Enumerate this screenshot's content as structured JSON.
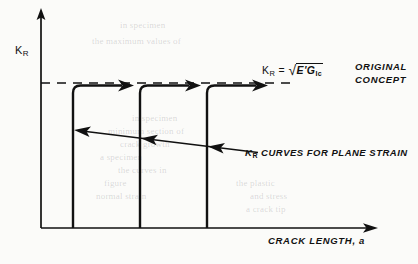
{
  "figure": {
    "type": "line-diagram",
    "background_color": "#fbfbf9",
    "ink_color": "#111111"
  },
  "axes": {
    "y_label": "K",
    "y_label_sub": "R",
    "x_label": "CRACK LENGTH, ",
    "x_label_italic": "a",
    "origin": {
      "x": 41,
      "y": 228
    },
    "y_axis_top": 10,
    "x_axis_right": 378
  },
  "plateau": {
    "dashed_level_y": 83,
    "equation_lhs": "K",
    "equation_lhs_sub": "R",
    "equation_eq": "=",
    "equation_radicand": "E'G",
    "equation_radicand_sub": "Ic",
    "radical_sign": "√",
    "concept_line1": "ORIGINAL",
    "concept_line2": "CONCEPT"
  },
  "annotations": {
    "curves_label_lhs": "K",
    "curves_label_sub": "R",
    "curves_label_rest": " CURVES FOR PLANE STRAIN"
  },
  "chart_data": {
    "type": "line",
    "title": "",
    "xlabel": "CRACK LENGTH, a",
    "ylabel": "K_R",
    "grid": false,
    "legend": "none",
    "axis_ticks": {
      "x": [],
      "y": []
    },
    "reference_lines": [
      {
        "name": "original-concept-plateau",
        "orientation": "horizontal",
        "style": "dashed",
        "label": "K_R = sqrt(E'G_Ic)",
        "annotation": "ORIGINAL CONCEPT"
      }
    ],
    "series": [
      {
        "name": "K_R curve 1 (plane strain)",
        "shape": "step-rise-then-plateau",
        "riser_x": 73,
        "rise_from_y": 228,
        "plateau_y": 85,
        "plateau_to_x": 131,
        "arrow": "right"
      },
      {
        "name": "K_R curve 2 (plane strain)",
        "shape": "step-rise-then-plateau",
        "riser_x": 140,
        "rise_from_y": 228,
        "plateau_y": 85,
        "plateau_to_x": 198,
        "arrow": "right"
      },
      {
        "name": "K_R curve 3 (plane strain)",
        "shape": "step-rise-then-plateau",
        "riser_x": 207,
        "rise_from_y": 228,
        "plateau_y": 85,
        "plateau_to_x": 266,
        "arrow": "right"
      }
    ],
    "leader_arrows": [
      {
        "from_x": 258,
        "from_y": 152,
        "to_x": 80,
        "to_y": 131
      },
      {
        "to_x": 147,
        "to_y": 139
      },
      {
        "to_x": 214,
        "to_y": 147
      }
    ]
  },
  "bleed_through": [
    {
      "text": "in specimen",
      "x": 120,
      "y": 20
    },
    {
      "text": "the maximum values of",
      "x": 92,
      "y": 36
    },
    {
      "text": "in specimen",
      "x": 132,
      "y": 113
    },
    {
      "text": "minimum section of",
      "x": 108,
      "y": 126
    },
    {
      "text": "crack growth",
      "x": 120,
      "y": 139
    },
    {
      "text": "a specimen",
      "x": 100,
      "y": 152
    },
    {
      "text": "the curves in",
      "x": 118,
      "y": 165
    },
    {
      "text": "figure",
      "x": 104,
      "y": 178
    },
    {
      "text": "normal strain",
      "x": 96,
      "y": 191
    },
    {
      "text": "the plastic",
      "x": 236,
      "y": 178
    },
    {
      "text": "and stress",
      "x": 250,
      "y": 191
    },
    {
      "text": "a crack tip",
      "x": 246,
      "y": 204
    }
  ]
}
